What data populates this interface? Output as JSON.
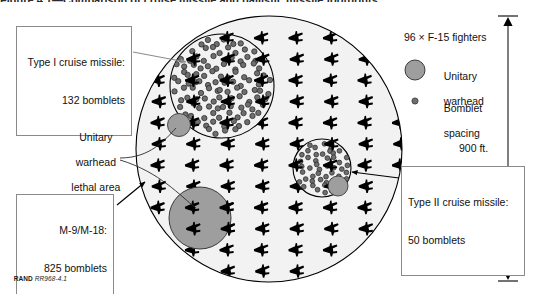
{
  "figure": {
    "title_cropped": "Figure 4.1—Comparison of cruise missile and ballistic missile footprints",
    "credit_prefix": "RAND",
    "credit_number": "RR968-4.1"
  },
  "callouts": [
    {
      "name": "type-1-callout",
      "line1": "Type I cruise missile:",
      "line2": "132 bomblets"
    },
    {
      "name": "type-2-callout",
      "line1": "Type II cruise missile:",
      "line2": "50 bomblets"
    },
    {
      "name": "m9-m18-callout",
      "line1": "M-9/M-18:",
      "line2": "825 bomblets"
    }
  ],
  "annotations": [
    {
      "name": "unitary-warhead-lethal-area-label",
      "line1": "Unitary",
      "line2": "warhead",
      "line3": "lethal area"
    }
  ],
  "legend": {
    "title": "96 × F-15 fighters",
    "items": [
      {
        "icon": "gray-circle-icon",
        "line1": "Unitary",
        "line2": "warhead"
      },
      {
        "icon": "small-dot-icon",
        "line1": "Bomblet",
        "line2": "spacing"
      }
    ]
  },
  "dimension": {
    "name": "vertical-extent",
    "label": "900 ft."
  },
  "chart_data": {
    "type": "scatter",
    "xlabel": "",
    "ylabel": "",
    "legend_position": "right",
    "grid": false,
    "units": "feet",
    "scene_scale_ft": 900,
    "target_array": {
      "name": "F-15 fighter parking array",
      "count": 96,
      "rows": 12,
      "columns": 8,
      "marker": "aircraft-silhouette"
    },
    "regions": [
      {
        "name": "main-dispersal-circle",
        "shape": "circle",
        "cx_px": 269,
        "cy_px": 149,
        "r_px": 133,
        "fill": "#f2f2f2",
        "stroke": "#000000",
        "role": "F-15 parking area boundary"
      },
      {
        "name": "type-1-cruise-missile-footprint",
        "shape": "circle",
        "cx_px": 222,
        "cy_px": 86,
        "r_px": 52,
        "bomblets": 132,
        "role": "Type I cruise missile bomblet pattern"
      },
      {
        "name": "type-2-cruise-missile-footprint",
        "shape": "circle",
        "cx_px": 322,
        "cy_px": 168,
        "r_px": 29,
        "bomblets": 50,
        "role": "Type II cruise missile bomblet pattern"
      },
      {
        "name": "m9-m18-unitary-lethal-area",
        "shape": "circle",
        "cx_px": 200,
        "cy_px": 218,
        "r_px": 31,
        "bomblets": 825,
        "fill": "#9e9e9e",
        "role": "Ballistic missile unitary warhead lethal area"
      },
      {
        "name": "type-1-unitary-warhead-lethal-area",
        "shape": "circle",
        "cx_px": 179,
        "cy_px": 125,
        "r_px": 11,
        "fill": "#9e9e9e",
        "role": "Unitary warhead lethal area"
      },
      {
        "name": "type-2-unitary-warhead-lethal-area",
        "shape": "circle",
        "cx_px": 338,
        "cy_px": 186,
        "r_px": 10,
        "fill": "#9e9e9e",
        "role": "Unitary warhead lethal area"
      }
    ],
    "colors": {
      "background": "#ffffff",
      "circle_fill": "#f2f2f2",
      "warhead_gray": "#9e9e9e",
      "bomblet_gray": "#6e6e6e",
      "aircraft_black": "#000000",
      "outline": "#000000",
      "callout_border": "#8a8a8a"
    }
  }
}
